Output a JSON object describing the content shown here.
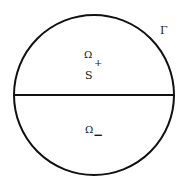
{
  "diagram": {
    "boundary_label": "Γ",
    "upper_region": {
      "symbol": "Ω",
      "subscript": "+"
    },
    "interface_label": "S",
    "lower_region": {
      "symbol": "Ω",
      "subscript": "−"
    },
    "stroke_color": "#111111",
    "background_color": "#ffffff"
  }
}
